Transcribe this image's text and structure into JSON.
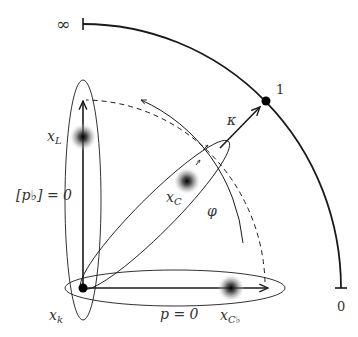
{
  "diagram": {
    "scale_labels": {
      "infinity": "∞",
      "one": "1",
      "zero": "0"
    },
    "axis_labels": {
      "vertical_condition": "[p♭] = 0",
      "horizontal_condition": "p = 0"
    },
    "points": {
      "origin": {
        "name": "x",
        "subscript": "k"
      },
      "left": {
        "name": "x",
        "subscript": "L"
      },
      "center": {
        "name": "x",
        "subscript": "C"
      },
      "flat": {
        "name": "x",
        "subscript": "C♭"
      }
    },
    "arrows": {
      "kappa": "κ",
      "phi": "φ"
    },
    "colors": {
      "stroke": "#1a1a1a",
      "blob_core": "#000000",
      "background": "#ffffff"
    }
  }
}
